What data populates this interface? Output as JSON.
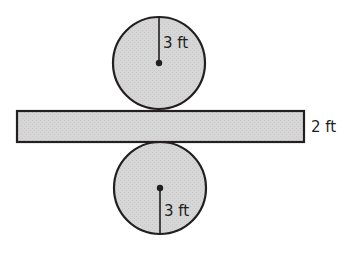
{
  "diagram": {
    "top_circle": {
      "radius_label": "3 ft"
    },
    "bar": {
      "height_label": "2 ft"
    },
    "bottom_circle": {
      "radius_label": "3 ft"
    }
  },
  "colors": {
    "fill": "#d4d4d4",
    "stroke": "#231f20",
    "background": "#ffffff"
  }
}
